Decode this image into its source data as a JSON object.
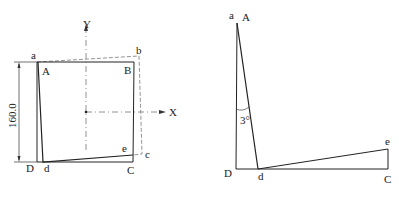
{
  "left_figure": {
    "labels": {
      "a": "a",
      "A": "A",
      "B": "B",
      "b": "b",
      "C": "C",
      "c": "c",
      "D": "D",
      "d": "d",
      "e": "e",
      "X": "X",
      "Y": "Y"
    },
    "dimension": "160.0"
  },
  "right_figure": {
    "labels": {
      "a": "a",
      "A": "A",
      "D": "D",
      "d": "d",
      "C": "C",
      "e": "e"
    },
    "angle": "3°"
  },
  "colors": {
    "line": "#222222",
    "dashed": "#888888",
    "background": "#ffffff"
  }
}
